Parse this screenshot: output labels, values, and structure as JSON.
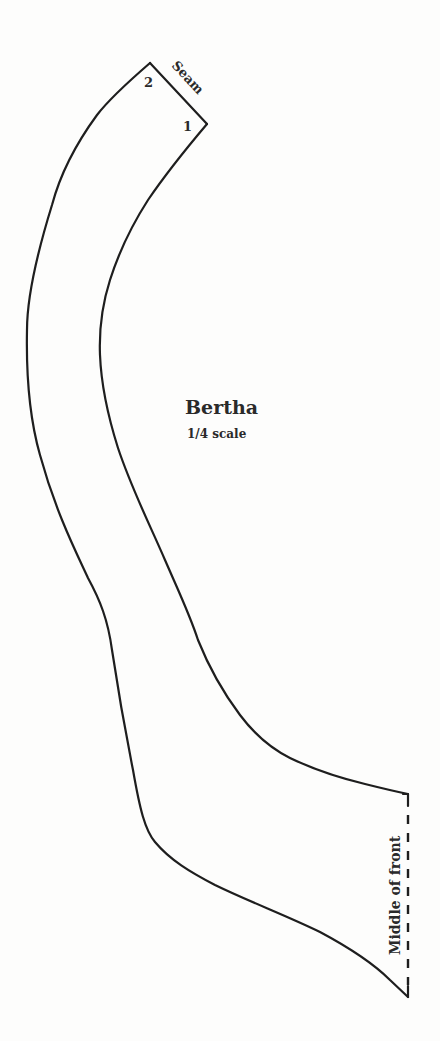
{
  "pattern": {
    "title": "Bertha",
    "scale": "1/4 scale",
    "labels": {
      "corner_top": "2",
      "corner_right": "1",
      "seam": "Seam",
      "fold_edge": "Middle of front"
    },
    "colors": {
      "line": "#1e1e1e",
      "background": "#fdfdfc"
    }
  }
}
